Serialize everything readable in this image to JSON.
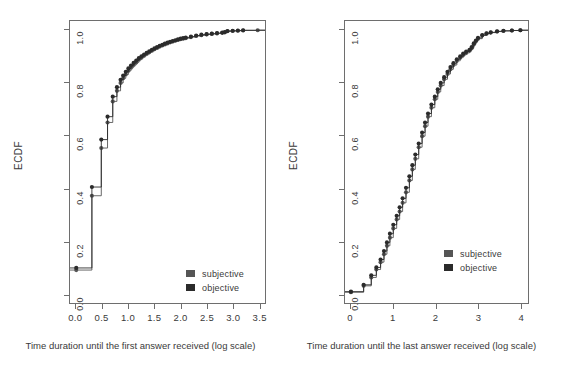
{
  "figure": {
    "panels": [
      {
        "id": "first-answer",
        "ylabel": "ECDF",
        "xlabel": "Time duration until the first answer received (log scale)",
        "xticks": [
          "0.0",
          "0.5",
          "1.0",
          "1.5",
          "2.0",
          "2.5",
          "3.0",
          "3.5"
        ],
        "yticks": [
          "0.0",
          "0.2",
          "0.4",
          "0.6",
          "0.8",
          "1.0"
        ],
        "legend": [
          {
            "label": "subjective",
            "color": "#555555"
          },
          {
            "label": "objective",
            "color": "#2b2b2b"
          }
        ]
      },
      {
        "id": "last-answer",
        "ylabel": "ECDF",
        "xlabel": "Time duration until the last answer received (log scale)",
        "xticks": [
          "0",
          "1",
          "2",
          "3",
          "4"
        ],
        "yticks": [
          "0.0",
          "0.2",
          "0.4",
          "0.6",
          "0.8",
          "1.0"
        ],
        "legend": [
          {
            "label": "subjective",
            "color": "#555555"
          },
          {
            "label": "objective",
            "color": "#2b2b2b"
          }
        ]
      }
    ]
  },
  "chart_data": [
    {
      "type": "line",
      "id": "first-answer",
      "title": "",
      "xlabel": "Time duration until the first answer received (log scale)",
      "ylabel": "ECDF",
      "xlim": [
        -0.12,
        3.62
      ],
      "ylim": [
        -0.035,
        1.035
      ],
      "grid": false,
      "legend_position": "bottom-right",
      "series": [
        {
          "name": "subjective",
          "color": "#555555",
          "style": "step-with-points",
          "x": [
            0.0,
            0.3,
            0.48,
            0.6,
            0.7,
            0.78,
            0.85,
            0.9,
            0.95,
            1.0,
            1.05,
            1.1,
            1.15,
            1.2,
            1.25,
            1.3,
            1.35,
            1.4,
            1.45,
            1.5,
            1.55,
            1.6,
            1.65,
            1.7,
            1.75,
            1.8,
            1.85,
            1.9,
            1.95,
            2.0,
            2.05,
            2.1,
            2.2,
            2.3,
            2.4,
            2.5,
            2.6,
            2.7,
            2.8,
            2.85,
            2.9,
            3.0,
            3.1,
            3.2,
            3.48
          ],
          "y": [
            0.09,
            0.372,
            0.553,
            0.65,
            0.73,
            0.77,
            0.8,
            0.818,
            0.832,
            0.846,
            0.858,
            0.868,
            0.878,
            0.888,
            0.896,
            0.903,
            0.91,
            0.916,
            0.922,
            0.928,
            0.933,
            0.938,
            0.942,
            0.946,
            0.95,
            0.954,
            0.957,
            0.96,
            0.963,
            0.966,
            0.968,
            0.97,
            0.974,
            0.978,
            0.981,
            0.984,
            0.986,
            0.988,
            0.99,
            0.992,
            0.996,
            0.997,
            0.998,
            0.999,
            1.0
          ]
        },
        {
          "name": "objective",
          "color": "#2b2b2b",
          "style": "step-with-points",
          "x": [
            0.0,
            0.3,
            0.48,
            0.6,
            0.7,
            0.78,
            0.85,
            0.9,
            0.95,
            1.0,
            1.05,
            1.1,
            1.15,
            1.2,
            1.25,
            1.3,
            1.35,
            1.4,
            1.45,
            1.5,
            1.55,
            1.6,
            1.65,
            1.7,
            1.75,
            1.8,
            1.85,
            1.9,
            1.95,
            2.0,
            2.05,
            2.1,
            2.2,
            2.3,
            2.4,
            2.5,
            2.6,
            2.7,
            2.8,
            2.85,
            2.9,
            3.0,
            3.1,
            3.2
          ],
          "y": [
            0.098,
            0.405,
            0.585,
            0.672,
            0.748,
            0.784,
            0.812,
            0.828,
            0.842,
            0.855,
            0.866,
            0.876,
            0.885,
            0.894,
            0.901,
            0.908,
            0.914,
            0.92,
            0.926,
            0.931,
            0.936,
            0.941,
            0.945,
            0.949,
            0.953,
            0.956,
            0.959,
            0.962,
            0.965,
            0.968,
            0.97,
            0.972,
            0.976,
            0.98,
            0.983,
            0.985,
            0.987,
            0.989,
            0.991,
            0.993,
            0.997,
            0.998,
            0.999,
            1.0
          ]
        }
      ]
    },
    {
      "type": "line",
      "id": "last-answer",
      "title": "",
      "xlabel": "Time duration until the last answer received (log scale)",
      "ylabel": "ECDF",
      "xlim": [
        -0.14,
        4.18
      ],
      "ylim": [
        -0.035,
        1.035
      ],
      "grid": false,
      "legend_position": "bottom-right",
      "series": [
        {
          "name": "subjective",
          "color": "#555555",
          "style": "step-with-points",
          "x": [
            0.0,
            0.3,
            0.48,
            0.6,
            0.7,
            0.78,
            0.85,
            0.92,
            1.0,
            1.08,
            1.15,
            1.22,
            1.3,
            1.38,
            1.45,
            1.52,
            1.6,
            1.68,
            1.75,
            1.82,
            1.9,
            1.98,
            2.05,
            2.12,
            2.2,
            2.28,
            2.35,
            2.42,
            2.5,
            2.58,
            2.65,
            2.72,
            2.8,
            2.85,
            2.9,
            2.95,
            3.0,
            3.1,
            3.2,
            3.3,
            3.45,
            3.6,
            3.8,
            4.0
          ],
          "y": [
            0.006,
            0.03,
            0.062,
            0.092,
            0.12,
            0.15,
            0.182,
            0.213,
            0.248,
            0.282,
            0.312,
            0.345,
            0.385,
            0.43,
            0.472,
            0.512,
            0.556,
            0.598,
            0.636,
            0.672,
            0.706,
            0.738,
            0.766,
            0.79,
            0.814,
            0.834,
            0.852,
            0.868,
            0.884,
            0.896,
            0.906,
            0.914,
            0.922,
            0.932,
            0.946,
            0.958,
            0.968,
            0.98,
            0.987,
            0.991,
            0.995,
            0.997,
            0.999,
            1.0
          ]
        },
        {
          "name": "objective",
          "color": "#2b2b2b",
          "style": "step-with-points",
          "x": [
            0.0,
            0.3,
            0.48,
            0.6,
            0.7,
            0.78,
            0.85,
            0.92,
            1.0,
            1.08,
            1.15,
            1.22,
            1.3,
            1.38,
            1.45,
            1.52,
            1.6,
            1.68,
            1.75,
            1.82,
            1.9,
            1.98,
            2.05,
            2.12,
            2.2,
            2.28,
            2.35,
            2.42,
            2.5,
            2.58,
            2.65,
            2.72,
            2.8,
            2.85,
            2.9,
            2.95,
            3.0,
            3.1,
            3.2,
            3.3,
            3.45,
            3.6,
            3.8,
            4.0
          ],
          "y": [
            0.008,
            0.034,
            0.07,
            0.1,
            0.13,
            0.162,
            0.195,
            0.228,
            0.262,
            0.296,
            0.328,
            0.362,
            0.402,
            0.446,
            0.488,
            0.528,
            0.57,
            0.612,
            0.65,
            0.684,
            0.718,
            0.748,
            0.776,
            0.8,
            0.822,
            0.842,
            0.86,
            0.875,
            0.89,
            0.901,
            0.911,
            0.919,
            0.926,
            0.936,
            0.95,
            0.961,
            0.971,
            0.982,
            0.988,
            0.992,
            0.996,
            0.998,
            0.999,
            1.0
          ]
        }
      ]
    }
  ]
}
